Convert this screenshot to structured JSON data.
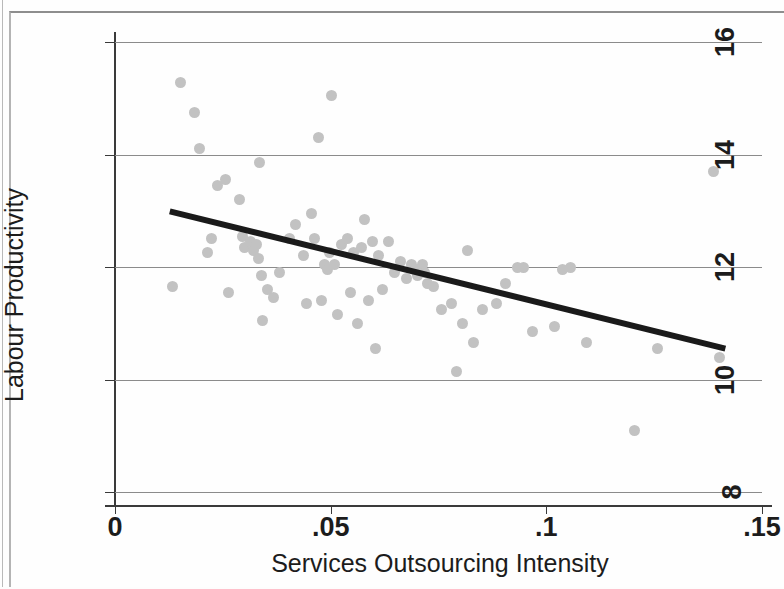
{
  "chart_data": {
    "type": "scatter",
    "title": "",
    "xlabel": "Services Outsourcing Intensity",
    "ylabel": "Labour Productivity",
    "xlim": [
      0,
      0.15
    ],
    "ylim": [
      8,
      16
    ],
    "xticks": [
      0,
      0.05,
      0.1,
      0.15
    ],
    "xtick_labels": [
      "0",
      ".05",
      ".1",
      ".15"
    ],
    "yticks": [
      8,
      10,
      12,
      14,
      16
    ],
    "ytick_labels": [
      "8",
      "10",
      "12",
      "14",
      "16"
    ],
    "grid": "horizontal",
    "legend": "none",
    "point_color": "#c2c2c2",
    "line_color": "#1a1a1a",
    "fit_line": {
      "name": "linear fit",
      "x": [
        0.0127,
        0.1415
      ],
      "y": [
        12.99,
        10.55
      ]
    },
    "series": [
      {
        "name": "Industries",
        "points": [
          [
            0.0133,
            11.65
          ],
          [
            0.0152,
            15.28
          ],
          [
            0.0185,
            14.75
          ],
          [
            0.0197,
            14.1
          ],
          [
            0.0214,
            12.25
          ],
          [
            0.0223,
            12.5
          ],
          [
            0.0238,
            13.45
          ],
          [
            0.0256,
            13.55
          ],
          [
            0.0264,
            11.55
          ],
          [
            0.0288,
            13.2
          ],
          [
            0.0296,
            12.55
          ],
          [
            0.0301,
            12.35
          ],
          [
            0.0314,
            12.45
          ],
          [
            0.0321,
            12.3
          ],
          [
            0.0327,
            12.4
          ],
          [
            0.0332,
            12.15
          ],
          [
            0.0336,
            13.85
          ],
          [
            0.0339,
            11.85
          ],
          [
            0.0341,
            11.05
          ],
          [
            0.0353,
            11.6
          ],
          [
            0.0368,
            11.45
          ],
          [
            0.0381,
            11.9
          ],
          [
            0.0404,
            12.5
          ],
          [
            0.0419,
            12.75
          ],
          [
            0.0438,
            12.2
          ],
          [
            0.0444,
            11.35
          ],
          [
            0.0456,
            12.95
          ],
          [
            0.0462,
            12.5
          ],
          [
            0.0471,
            14.3
          ],
          [
            0.0478,
            11.4
          ],
          [
            0.0486,
            12.05
          ],
          [
            0.0492,
            11.95
          ],
          [
            0.0497,
            12.25
          ],
          [
            0.0502,
            15.05
          ],
          [
            0.0508,
            12.05
          ],
          [
            0.0515,
            11.15
          ],
          [
            0.0526,
            12.4
          ],
          [
            0.0538,
            12.5
          ],
          [
            0.0545,
            11.55
          ],
          [
            0.0554,
            12.25
          ],
          [
            0.0562,
            11.0
          ],
          [
            0.0571,
            12.35
          ],
          [
            0.0579,
            12.85
          ],
          [
            0.0588,
            11.4
          ],
          [
            0.0596,
            12.45
          ],
          [
            0.0604,
            10.55
          ],
          [
            0.0612,
            12.2
          ],
          [
            0.0621,
            11.6
          ],
          [
            0.0634,
            12.45
          ],
          [
            0.0648,
            11.9
          ],
          [
            0.0662,
            12.1
          ],
          [
            0.0675,
            11.8
          ],
          [
            0.0688,
            12.05
          ],
          [
            0.0695,
            11.95
          ],
          [
            0.0702,
            11.85
          ],
          [
            0.0712,
            12.05
          ],
          [
            0.0718,
            11.9
          ],
          [
            0.0725,
            11.7
          ],
          [
            0.0738,
            11.65
          ],
          [
            0.0756,
            11.25
          ],
          [
            0.0779,
            11.35
          ],
          [
            0.0792,
            10.15
          ],
          [
            0.0806,
            11.0
          ],
          [
            0.0818,
            12.3
          ],
          [
            0.0832,
            10.65
          ],
          [
            0.0851,
            11.25
          ],
          [
            0.0884,
            11.35
          ],
          [
            0.0906,
            11.7
          ],
          [
            0.0932,
            12.0
          ],
          [
            0.0946,
            12.0
          ],
          [
            0.0967,
            10.85
          ],
          [
            0.1018,
            10.95
          ],
          [
            0.1038,
            11.95
          ],
          [
            0.1056,
            12.0
          ],
          [
            0.1092,
            10.65
          ],
          [
            0.1205,
            9.1
          ],
          [
            0.1258,
            10.55
          ],
          [
            0.1388,
            13.7
          ],
          [
            0.1402,
            10.4
          ]
        ]
      }
    ]
  }
}
